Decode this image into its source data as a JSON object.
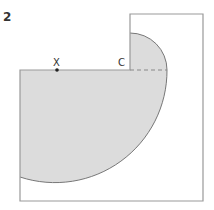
{
  "question_number": "2",
  "labels": {
    "point_x": "X",
    "point_c": "C"
  },
  "colors": {
    "shaded_region": "#dcdcdc",
    "outline": "#999999",
    "arc_outline": "#777777",
    "text": "#333333"
  },
  "geometry": {
    "outer_shape": "L-shaped outline (lower-left square joined to tall right rectangle)",
    "shaded_region": "quarter circle centred at C (upper-right) plus large arc sweeping from C's level to the left edge",
    "dashed_line": "horizontal radius from C to arc edge"
  }
}
